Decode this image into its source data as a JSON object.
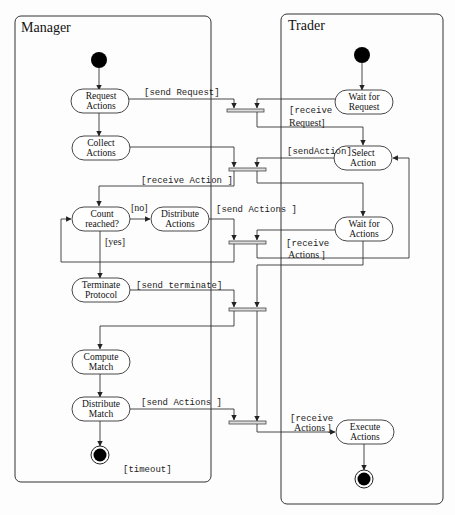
{
  "swimlanes": [
    {
      "id": "manager",
      "title": "Manager"
    },
    {
      "id": "trader",
      "title": "Trader"
    }
  ],
  "manager_nodes": {
    "request_actions": [
      "Request",
      "Actions"
    ],
    "collect_actions": [
      "Collect",
      "Actions"
    ],
    "count_reached": [
      "Count",
      "reached?"
    ],
    "distribute_actions": [
      "Distribute",
      "Actions"
    ],
    "terminate_protocol": [
      "Terminate",
      "Protocol"
    ],
    "compute_match": [
      "Compute",
      "Match"
    ],
    "distribute_match": [
      "Distribute",
      "Match"
    ]
  },
  "trader_nodes": {
    "wait_for_request": [
      "Wait for",
      "Request"
    ],
    "select_action": [
      "Select",
      "Action"
    ],
    "wait_for_actions": [
      "Wait for",
      "Actions"
    ],
    "execute_actions": [
      "Execute",
      "Actions"
    ]
  },
  "guards": {
    "send_request": "[send Request]",
    "receive_request_1": "[receive",
    "receive_request_2": "Request]",
    "send_action": "[sendAction]",
    "receive_action": "[receive Action ]",
    "no": "[no]",
    "yes": "[yes]",
    "send_actions_1": "[send Actions ]",
    "receive_actions_1a": "[receive",
    "receive_actions_1b": "Actions ]",
    "send_terminate": "[send terminate]",
    "send_actions_2": "[send Actions ]",
    "receive_actions_2a": "[receive",
    "receive_actions_2b": "Actions ]",
    "timeout": "[timeout]"
  }
}
